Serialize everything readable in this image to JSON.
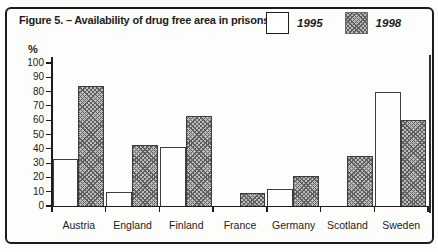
{
  "figure": {
    "title": "Figure 5. – Availability of drug free area in prisons.",
    "percent_label": "%"
  },
  "legend": {
    "items": [
      {
        "label": "1995",
        "swatch": "white"
      },
      {
        "label": "1998",
        "swatch": "hatched"
      }
    ]
  },
  "colors": {
    "ink": "#1c1c1c",
    "paper": "#fdfdfc",
    "hatch_base": "#bdbdbd",
    "hatch_line": "#5f5f5f",
    "bar_1995_fill": "#fefefe"
  },
  "chart_data": {
    "type": "bar",
    "title": "Figure 5. – Availability of drug free area in prisons.",
    "xlabel": "",
    "ylabel": "%",
    "ylim": [
      0,
      100
    ],
    "yticks": [
      0,
      10,
      20,
      30,
      40,
      50,
      60,
      70,
      80,
      90,
      100
    ],
    "grid": false,
    "legend_position": "top-right",
    "categories": [
      "Austria",
      "England",
      "Finland",
      "France",
      "Germany",
      "Scotland",
      "Sweden"
    ],
    "series": [
      {
        "name": "1995",
        "values": [
          33,
          10,
          41,
          null,
          12,
          null,
          80
        ]
      },
      {
        "name": "1998",
        "values": [
          84,
          43,
          63,
          9,
          21,
          35,
          60
        ]
      }
    ]
  }
}
